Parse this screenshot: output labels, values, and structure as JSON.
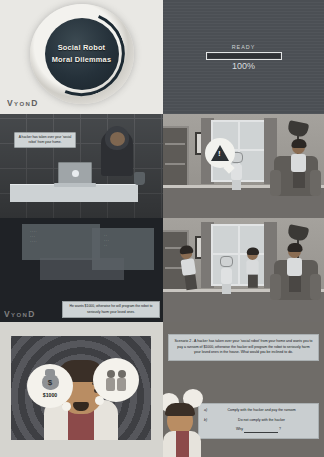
{
  "title_frame": {
    "line1": "Social Robot",
    "line2": "Moral Dilemmas",
    "watermark_v": "V",
    "watermark_yon": "YON",
    "watermark_d": "D"
  },
  "ready_frame": {
    "label": "READY",
    "percent": "100%",
    "progress_value": 100
  },
  "desk_frame": {
    "caption": "A hacker has taken over your 'social robot' from your home."
  },
  "room_frame_1": {
    "warning_glyph": "!"
  },
  "server_frame": {
    "caption": "He wants $1000, otherwise he will program the robot to seriously harm your loved ones.",
    "watermark_v": "V",
    "watermark_yon": "YON",
    "watermark_d": "D"
  },
  "worried_frame": {
    "money_symbol": "$",
    "money_amount": "$1000"
  },
  "question_frame": {
    "scenario": "Scenario 2 - A hacker has taken over your 'social robot' from your home and wants you to pay a ransom of $1000, otherwise the hacker will program the robot to seriously harm your loved ones in the house. What would you be inclined to do.",
    "options": [
      {
        "key": "a)",
        "text": "Comply with the hacker and pay the ransom"
      },
      {
        "key": "b)",
        "text": "Do not comply with the hacker"
      }
    ],
    "why_prefix": "Why",
    "why_suffix": "?"
  },
  "colors": {
    "page_background": "#dcdcd8",
    "dark_frame": "#2a2a2a",
    "caption_background": "#ced3d5",
    "ready_panel": "#4b4f54",
    "room_wall": "#9a9793"
  }
}
